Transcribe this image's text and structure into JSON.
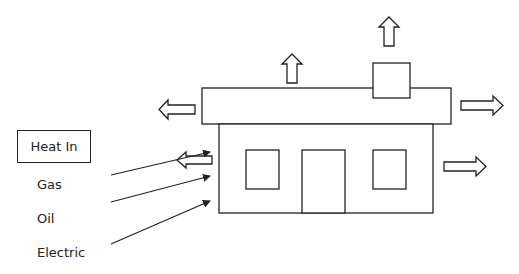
{
  "diagram": {
    "title_box": "Heat In",
    "sources": [
      {
        "label": "Gas"
      },
      {
        "label": "Oil"
      },
      {
        "label": "Electric"
      }
    ],
    "house": {
      "parts": [
        "roof",
        "chimney",
        "walls",
        "left-window",
        "door",
        "right-window"
      ]
    },
    "heat_loss_arrows": [
      {
        "location": "roof-top",
        "direction": "up"
      },
      {
        "location": "chimney-top",
        "direction": "up"
      },
      {
        "location": "roof-left",
        "direction": "left"
      },
      {
        "location": "roof-right",
        "direction": "right"
      },
      {
        "location": "wall-left",
        "direction": "left"
      },
      {
        "location": "wall-right",
        "direction": "right"
      }
    ],
    "colors": {
      "stroke": "#222222",
      "background": "#ffffff"
    }
  }
}
